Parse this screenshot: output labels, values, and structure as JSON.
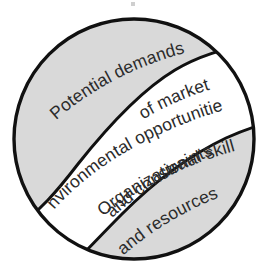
{
  "diagram": {
    "shape": "circle",
    "outline_color": "#111111",
    "band_fill_gray": "#d9d9d9",
    "band_fill_white": "#ffffff",
    "text_color": "#2b2b2b",
    "bands": [
      {
        "id": "top",
        "fill": "#d9d9d9",
        "lines": [
          "Potential demands",
          "of market"
        ],
        "line1": "Potential demands",
        "line2": "of market"
      },
      {
        "id": "middle",
        "fill": "#ffffff",
        "lines": [
          "Environmental opportunities",
          "and constraints"
        ],
        "line1": "Environmental opportunities",
        "line2": "and constraints"
      },
      {
        "id": "bottom",
        "fill": "#d9d9d9",
        "lines": [
          "Organizational skills",
          "and resources"
        ],
        "line1": "Organizational skills",
        "line2": "and resources"
      }
    ]
  }
}
